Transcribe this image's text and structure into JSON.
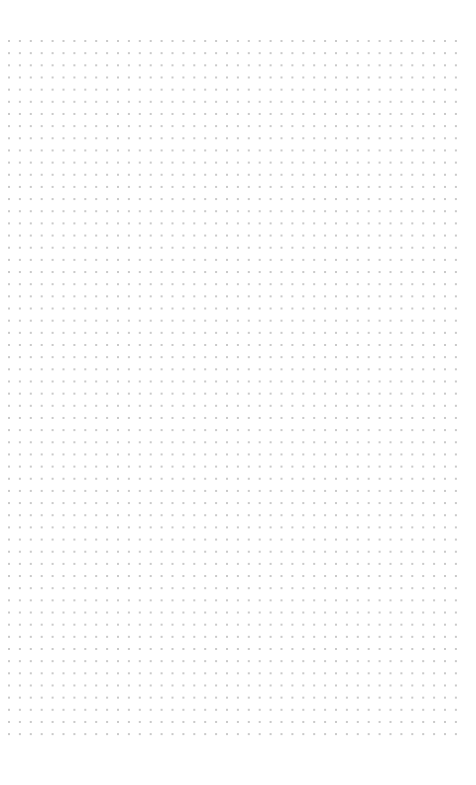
{
  "page": {
    "background": "#ffffff",
    "width": 476,
    "height": 785
  },
  "dot_grid": {
    "dot_color": "#c9c9c9",
    "dot_size": 2,
    "origin_x": 9,
    "origin_y": 41,
    "spacing_x": 10.9,
    "spacing_y": 12.16,
    "columns": 42,
    "rows": 58
  }
}
